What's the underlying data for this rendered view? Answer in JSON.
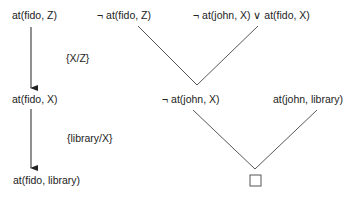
{
  "derivation": {
    "left_chain": {
      "step1": "at(fido, Z)",
      "substitution1": "{X/Z}",
      "step2": "at(fido, X)",
      "substitution2": "{library/X}",
      "step3": "at(fido, library)"
    },
    "resolution_tree": {
      "clause_a": "¬ at(fido, Z)",
      "clause_b": "¬ at(john, X) ∨ at(fido, X)",
      "resolvent_1": "¬ at(john, X)",
      "clause_c": "at(john, library)",
      "empty_clause_symbol": "□"
    }
  },
  "colors": {
    "text": "#222222",
    "lines": "#444444"
  }
}
